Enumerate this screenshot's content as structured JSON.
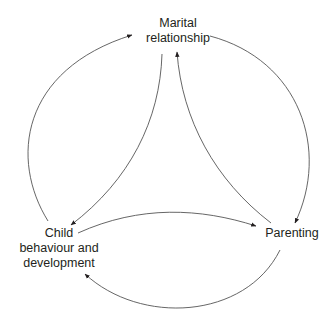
{
  "diagram": {
    "type": "cyclic-relationship-diagram",
    "nodes": {
      "marital": {
        "line1": "Marital",
        "line2": "relationship"
      },
      "child": {
        "line1": "Child",
        "line2": "behaviour and",
        "line3": "development"
      },
      "parenting": {
        "line1": "Parenting"
      }
    },
    "edges": [
      {
        "from": "Child behaviour and development",
        "to": "Marital relationship",
        "style": "outer-arc"
      },
      {
        "from": "Marital relationship",
        "to": "Parenting",
        "style": "outer-arc"
      },
      {
        "from": "Parenting",
        "to": "Child behaviour and development",
        "style": "outer-arc"
      },
      {
        "from": "Marital relationship",
        "to": "Child behaviour and development",
        "style": "inner-arc"
      },
      {
        "from": "Parenting",
        "to": "Marital relationship",
        "style": "inner-arc"
      },
      {
        "from": "Child behaviour and development",
        "to": "Parenting",
        "style": "inner-arc"
      }
    ],
    "colors": {
      "line": "#555555",
      "text": "#231f20",
      "background": "#ffffff"
    }
  }
}
